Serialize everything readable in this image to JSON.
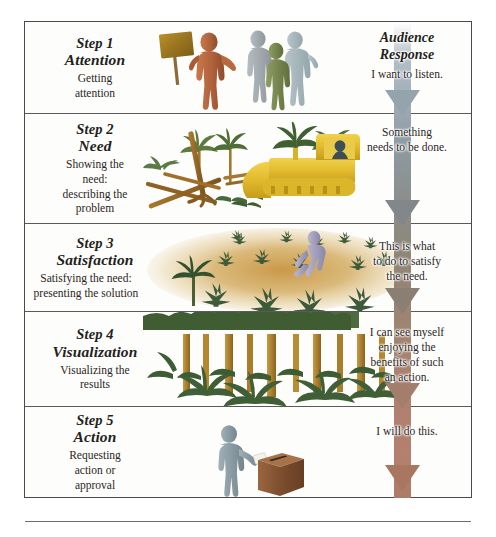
{
  "diagram": {
    "response_header": "Audience\nResponse",
    "response_header_line1": "Audience",
    "response_header_line2": "Response"
  },
  "steps": [
    {
      "number": "Step 1",
      "name": "Attention",
      "description": "Getting\nattention",
      "description_line1": "Getting",
      "description_line2": "attention",
      "response": "I want to listen.",
      "response_line1": "I want to listen.",
      "illustration": "speaker-with-sign-and-audience",
      "arrow_color": "#b2bdc5"
    },
    {
      "number": "Step 2",
      "name": "Need",
      "description": "Showing the\nneed:\ndescribing the\nproblem",
      "description_line1": "Showing the",
      "description_line2": "need:",
      "description_line3": "describing the",
      "description_line4": "problem",
      "response": "Something\nneeds to be done.",
      "response_line1": "Something",
      "response_line2": "needs to be done.",
      "illustration": "bulldozer-clearing-trees",
      "arrow_color": "#8f9aa0"
    },
    {
      "number": "Step 3",
      "name": "Satisfaction",
      "description": "Satisfying the need:\npresenting the solution",
      "description_line1": "Satisfying the need:",
      "description_line2": "presenting the solution",
      "response": "This is what\nto do to satisfy\nthe need.",
      "response_line1": "This is what",
      "response_line2": "to do to satisfy",
      "response_line3": "the need.",
      "illustration": "planting-seedlings-in-soil",
      "arrow_color": "#8b8576"
    },
    {
      "number": "Step 4",
      "name": "Visualization",
      "description": "Visualizing the\nresults",
      "description_line1": "Visualizing the",
      "description_line2": "results",
      "response": "I can see myself\nenjoying the\nbenefits of such\nan action.",
      "response_line1": "I can see myself",
      "response_line2": "enjoying the",
      "response_line3": "benefits of such",
      "response_line4": "an action.",
      "illustration": "grown-rainforest",
      "arrow_color": "#a4826f"
    },
    {
      "number": "Step 5",
      "name": "Action",
      "description": "Requesting\naction or\napproval",
      "description_line1": "Requesting",
      "description_line2": "action or",
      "description_line3": "approval",
      "response": "I will do this.",
      "response_line1": "I will do this.",
      "illustration": "person-casting-ballot",
      "arrow_color": "#ae7b67"
    }
  ],
  "colors": {
    "frame_border": "#4a4a4a",
    "row_divider": "#5a5a5a",
    "text": "#231f20",
    "arrow_top": "#c3cdd4",
    "arrow_bottom": "#ad7a66",
    "bulldozer_yellow": "#e8c338",
    "foliage_green": "#3d5a3a",
    "soil_tan": "#c79a4e",
    "speaker_brown": "#b5683f",
    "ballot_box_brown": "#8a5a3c"
  }
}
